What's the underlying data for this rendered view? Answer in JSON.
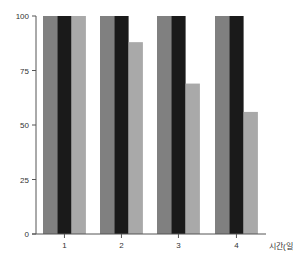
{
  "chart_data": {
    "type": "bar",
    "title": "",
    "xlabel": "시간(일)",
    "ylabel": "",
    "categories": [
      "1",
      "2",
      "3",
      "4"
    ],
    "series": [
      {
        "name": "series-1",
        "color": "#808080",
        "values": [
          100,
          100,
          100,
          100
        ]
      },
      {
        "name": "series-2",
        "color": "#1a1a1a",
        "values": [
          100,
          100,
          100,
          100
        ]
      },
      {
        "name": "series-3",
        "color": "#a9a9a9",
        "values": [
          100,
          88,
          69,
          56
        ]
      }
    ],
    "ylim": [
      0,
      100
    ],
    "yticks": [
      0,
      25,
      50,
      75,
      100
    ],
    "grid": false,
    "legend": "none"
  }
}
